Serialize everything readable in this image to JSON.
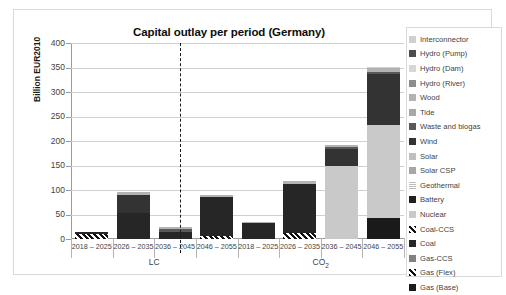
{
  "chart_data": {
    "type": "bar",
    "title": "Capital outlay per period (Germany)",
    "xlabel": "",
    "ylabel": "Billion EUR2010",
    "ylim": [
      0,
      400
    ],
    "ytick_values": [
      0,
      50,
      100,
      150,
      200,
      250,
      300,
      350,
      400
    ],
    "grid": true,
    "legend_position": "right",
    "stacked": true,
    "groups": [
      {
        "name": "LC",
        "categories": [
          "2018 – 2025",
          "2026 – 2035",
          "2036 – 2045",
          "2046 – 2055"
        ]
      },
      {
        "name": "CO2",
        "name_display": "CO",
        "name_sub": "2",
        "categories": [
          "2018 – 2025",
          "2026 – 2035",
          "2036 – 2045",
          "2046 – 2055"
        ]
      }
    ],
    "categories": [
      "LC 2018 – 2025",
      "LC 2026 – 2035",
      "LC 2036 – 2045",
      "LC 2046 – 2055",
      "CO2 2018 – 2025",
      "CO2 2026 – 2035",
      "CO2 2036 – 2045",
      "CO2 2046 – 2055"
    ],
    "series": [
      {
        "name": "Gas (Base)",
        "color": "#1a1a1a",
        "pattern": "solid",
        "values": [
          0,
          0,
          0,
          0,
          0,
          0,
          0,
          42
        ]
      },
      {
        "name": "Gas (Flex)",
        "color": "#d9d9d9",
        "pattern": "diagonal-hatch",
        "values": [
          11,
          0,
          0,
          7,
          0,
          12,
          0,
          0
        ]
      },
      {
        "name": "Gas-CCS",
        "color": "#808080",
        "pattern": "solid",
        "values": [
          0,
          0,
          0,
          0,
          0,
          0,
          0,
          0
        ]
      },
      {
        "name": "Coal",
        "color": "#262626",
        "pattern": "solid",
        "values": [
          4,
          54,
          14,
          78,
          32,
          101,
          0,
          0
        ]
      },
      {
        "name": "Coal-CCS",
        "color": "#404040",
        "pattern": "diagonal-hatch",
        "values": [
          0,
          0,
          0,
          0,
          0,
          0,
          0,
          0
        ]
      },
      {
        "name": "Nuclear",
        "color": "#c9c9c9",
        "pattern": "solid",
        "values": [
          0,
          0,
          0,
          0,
          0,
          0,
          150,
          190
        ]
      },
      {
        "name": "Battery",
        "color": "#1f1f1f",
        "pattern": "solid",
        "values": [
          0,
          0,
          0,
          0,
          0,
          0,
          0,
          0
        ]
      },
      {
        "name": "Geothermal",
        "color": "#bdbdbd",
        "pattern": "horizontal-hatch",
        "values": [
          0,
          0,
          0,
          0,
          0,
          0,
          0,
          0
        ]
      },
      {
        "name": "Solar CSP",
        "color": "#a6a6a6",
        "pattern": "solid",
        "values": [
          0,
          0,
          0,
          0,
          0,
          0,
          0,
          0
        ]
      },
      {
        "name": "Solar",
        "color": "#bfbfbf",
        "pattern": "solid",
        "values": [
          0,
          0,
          0,
          0,
          0,
          0,
          0,
          0
        ]
      },
      {
        "name": "Wind",
        "color": "#333333",
        "pattern": "solid",
        "values": [
          0,
          36,
          0,
          0,
          0,
          0,
          33,
          104
        ]
      },
      {
        "name": "Waste and biogas",
        "color": "#595959",
        "pattern": "solid",
        "values": [
          0,
          0,
          6,
          0,
          0,
          0,
          4,
          5
        ]
      },
      {
        "name": "Tide",
        "color": "#a8a8a8",
        "pattern": "solid",
        "values": [
          0,
          0,
          0,
          0,
          0,
          0,
          0,
          0
        ]
      },
      {
        "name": "Wood",
        "color": "#b3b3b3",
        "pattern": "solid",
        "values": [
          0,
          5,
          4,
          5,
          2,
          6,
          5,
          8
        ]
      },
      {
        "name": "Hydro (River)",
        "color": "#8c8c8c",
        "pattern": "solid",
        "values": [
          0,
          0,
          0,
          0,
          0,
          0,
          0,
          0
        ]
      },
      {
        "name": "Hydro (Dam)",
        "color": "#d6d6d6",
        "pattern": "solid",
        "values": [
          0,
          0,
          0,
          0,
          0,
          0,
          0,
          0
        ]
      },
      {
        "name": "Hydro (Pump)",
        "color": "#4d4d4d",
        "pattern": "solid",
        "values": [
          0,
          0,
          0,
          0,
          0,
          0,
          0,
          2
        ]
      },
      {
        "name": "Interconnector",
        "color": "#d0d0d0",
        "pattern": "solid",
        "values": [
          0,
          0,
          0,
          0,
          0,
          0,
          0,
          1
        ]
      }
    ],
    "bar_totals": [
      15,
      95,
      24,
      90,
      34,
      119,
      192,
      352
    ]
  },
  "legend": {
    "items": [
      {
        "label": "Interconnector",
        "swatch": "legend-swatch-interconnector"
      },
      {
        "label": "Hydro (Pump)",
        "swatch": "legend-swatch-hydro-pump"
      },
      {
        "label": "Hydro (Dam)",
        "swatch": "legend-swatch-hydro-dam"
      },
      {
        "label": "Hydro (River)",
        "swatch": "legend-swatch-hydro-river"
      },
      {
        "label": "Wood",
        "swatch": "legend-swatch-wood"
      },
      {
        "label": "Tide",
        "swatch": "legend-swatch-tide"
      },
      {
        "label": "Waste and biogas",
        "swatch": "legend-swatch-waste-biogas"
      },
      {
        "label": "Wind",
        "swatch": "legend-swatch-wind"
      },
      {
        "label": "Solar",
        "swatch": "legend-swatch-solar"
      },
      {
        "label": "Solar CSP",
        "swatch": "legend-swatch-solar-csp"
      },
      {
        "label": "Geothermal",
        "swatch": "legend-swatch-geothermal"
      },
      {
        "label": "Battery",
        "swatch": "legend-swatch-battery"
      },
      {
        "label": "Nuclear",
        "swatch": "legend-swatch-nuclear"
      },
      {
        "label": "Coal-CCS",
        "swatch": "legend-swatch-coal-ccs"
      },
      {
        "label": "Coal",
        "swatch": "legend-swatch-coal"
      },
      {
        "label": "Gas-CCS",
        "swatch": "legend-swatch-gas-ccs"
      },
      {
        "label": "Gas (Flex)",
        "swatch": "legend-swatch-gas-flex"
      },
      {
        "label": "Gas (Base)",
        "swatch": "legend-swatch-gas-base"
      }
    ]
  }
}
